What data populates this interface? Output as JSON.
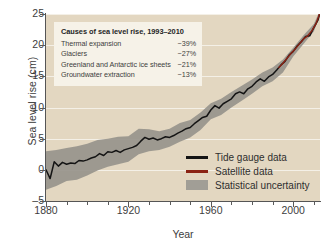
{
  "chart_data": {
    "type": "line",
    "title": "",
    "xlabel": "Year",
    "ylabel": "Sea level rise (cm)",
    "xlim": [
      1880,
      2013
    ],
    "ylim": [
      -5,
      25
    ],
    "grid": true,
    "legend_position": "bottom-right",
    "xticks": [
      {
        "value": 1880,
        "label": "1880",
        "major": true
      },
      {
        "value": 1890,
        "label": "",
        "major": false
      },
      {
        "value": 1900,
        "label": "",
        "major": false
      },
      {
        "value": 1910,
        "label": "",
        "major": false
      },
      {
        "value": 1920,
        "label": "1920",
        "major": true
      },
      {
        "value": 1930,
        "label": "",
        "major": false
      },
      {
        "value": 1940,
        "label": "",
        "major": false
      },
      {
        "value": 1950,
        "label": "",
        "major": false
      },
      {
        "value": 1960,
        "label": "1960",
        "major": true
      },
      {
        "value": 1970,
        "label": "",
        "major": false
      },
      {
        "value": 1980,
        "label": "",
        "major": false
      },
      {
        "value": 1990,
        "label": "",
        "major": false
      },
      {
        "value": 2000,
        "label": "2000",
        "major": true
      },
      {
        "value": 2010,
        "label": "",
        "major": false
      }
    ],
    "yticks": [
      {
        "value": 25,
        "label": "25"
      },
      {
        "value": 20,
        "label": "20"
      },
      {
        "value": 15,
        "label": "15"
      },
      {
        "value": 10,
        "label": "10"
      },
      {
        "value": 5,
        "label": "5"
      },
      {
        "value": 0,
        "label": "0"
      },
      {
        "value": -5,
        "−label": "",
        "label": "–5"
      }
    ],
    "series": [
      {
        "name": "Tide gauge data",
        "color": "#141414",
        "type": "line",
        "x": [
          1880,
          1882,
          1884,
          1886,
          1888,
          1890,
          1892,
          1894,
          1896,
          1898,
          1900,
          1902,
          1904,
          1906,
          1908,
          1910,
          1912,
          1914,
          1916,
          1918,
          1920,
          1922,
          1924,
          1926,
          1928,
          1930,
          1932,
          1934,
          1936,
          1938,
          1940,
          1942,
          1944,
          1946,
          1948,
          1950,
          1952,
          1954,
          1956,
          1958,
          1960,
          1962,
          1964,
          1966,
          1968,
          1970,
          1972,
          1974,
          1976,
          1978,
          1980,
          1982,
          1984,
          1986,
          1988,
          1990,
          1992,
          1994,
          1996,
          1998,
          2000,
          2002,
          2004,
          2006,
          2008,
          2010,
          2012,
          2013
        ],
        "values": [
          0.0,
          -1.4,
          1.3,
          0.6,
          1.2,
          0.9,
          1.1,
          1.0,
          1.5,
          1.4,
          1.6,
          1.9,
          2.1,
          2.6,
          2.3,
          2.9,
          2.8,
          3.1,
          2.8,
          3.2,
          3.4,
          3.6,
          3.9,
          4.6,
          5.2,
          4.9,
          5.1,
          4.8,
          5.0,
          5.3,
          5.2,
          5.5,
          5.9,
          6.2,
          6.6,
          6.8,
          7.4,
          7.9,
          8.4,
          8.6,
          9.6,
          10.3,
          9.9,
          10.6,
          11.0,
          11.4,
          12.2,
          12.5,
          12.2,
          13.0,
          13.4,
          14.1,
          14.6,
          14.2,
          14.9,
          15.3,
          16.0,
          16.8,
          17.4,
          18.4,
          19.0,
          19.9,
          20.6,
          21.4,
          21.5,
          22.8,
          24.0,
          25.2
        ]
      },
      {
        "name": "Satellite data",
        "color": "#8b2314",
        "type": "line",
        "x": [
          1993,
          1995,
          1997,
          1999,
          2001,
          2003,
          2005,
          2007,
          2009,
          2011,
          2013
        ],
        "values": [
          16.4,
          17.1,
          17.9,
          18.7,
          19.4,
          20.2,
          21.0,
          21.5,
          22.3,
          23.4,
          25.2
        ]
      }
    ],
    "uncertainty_band": {
      "name": "Statistical uncertainty",
      "color": "#97948c",
      "x": [
        1880,
        1885,
        1890,
        1895,
        1900,
        1905,
        1910,
        1915,
        1920,
        1925,
        1930,
        1935,
        1940,
        1945,
        1950,
        1955,
        1960,
        1965,
        1970,
        1975,
        1980,
        1985,
        1990,
        1995,
        2000,
        2005,
        2010,
        2013
      ],
      "upper": [
        3.0,
        3.2,
        3.5,
        3.8,
        4.2,
        4.8,
        5.0,
        5.3,
        5.4,
        6.6,
        6.5,
        6.2,
        6.6,
        7.5,
        8.0,
        9.2,
        10.7,
        11.4,
        12.5,
        13.5,
        14.5,
        15.6,
        16.4,
        17.7,
        19.6,
        21.6,
        23.4,
        25.6
      ],
      "lower": [
        -3.2,
        -2.6,
        -1.8,
        -1.6,
        -0.9,
        -0.1,
        0.5,
        0.9,
        1.3,
        2.5,
        3.0,
        3.2,
        3.7,
        4.5,
        5.2,
        6.4,
        8.1,
        8.8,
        10.0,
        11.1,
        12.2,
        13.4,
        14.2,
        15.6,
        18.2,
        20.2,
        22.2,
        24.8
      ]
    }
  },
  "annotation": {
    "title": "Causes of sea level rise, 1993–2010",
    "rows": [
      {
        "label": "Thermal expansion",
        "value": "~39%"
      },
      {
        "label": "Glaciers",
        "value": "~27%"
      },
      {
        "label": "Greenland and Antarctic ice sheets",
        "value": "~21%"
      },
      {
        "label": "Groundwater extraction",
        "value": "~13%"
      }
    ]
  },
  "legend": {
    "items": [
      {
        "label": "Tide gauge data",
        "color": "#141414",
        "style": "line"
      },
      {
        "label": "Satellite data",
        "color": "#8b2314",
        "style": "line"
      },
      {
        "label": "Statistical uncertainty",
        "color": "#a19e96",
        "style": "block"
      }
    ]
  },
  "colors": {
    "plot_background": "#e3d7c1",
    "page_background": "#ffffff",
    "annotation_background": "#f6f2e8",
    "gridline": "#ffffff",
    "axis": "#555555",
    "tide_gauge": "#141414",
    "satellite": "#8b2314",
    "uncertainty": "#97948c"
  }
}
